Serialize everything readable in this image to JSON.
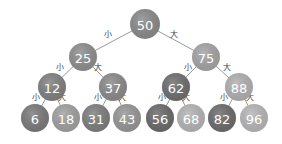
{
  "diagram": {
    "type": "binary-search-tree",
    "edge_labels": {
      "left": "小",
      "right": "大"
    },
    "nodes": [
      {
        "id": "n50",
        "value": "50",
        "x": 145,
        "y": 24,
        "r": 15,
        "color": "#8a8a8a"
      },
      {
        "id": "n25",
        "value": "25",
        "x": 83,
        "y": 57,
        "r": 14,
        "color": "#8e8e8e"
      },
      {
        "id": "n75",
        "value": "75",
        "x": 206,
        "y": 57,
        "r": 14,
        "color": "#a4a4a4"
      },
      {
        "id": "n12",
        "value": "12",
        "x": 52,
        "y": 87,
        "r": 14,
        "color": "#808080"
      },
      {
        "id": "n37",
        "value": "37",
        "x": 113,
        "y": 87,
        "r": 14,
        "color": "#8a8a8a"
      },
      {
        "id": "n62",
        "value": "62",
        "x": 176,
        "y": 87,
        "r": 14,
        "color": "#6e6e6e"
      },
      {
        "id": "n88",
        "value": "88",
        "x": 239,
        "y": 87,
        "r": 14,
        "color": "#b0b0b0"
      },
      {
        "id": "n6",
        "value": "6",
        "x": 35,
        "y": 118,
        "r": 14,
        "color": "#7a7a7a"
      },
      {
        "id": "n18",
        "value": "18",
        "x": 66,
        "y": 118,
        "r": 14,
        "color": "#a0a0a0"
      },
      {
        "id": "n31",
        "value": "31",
        "x": 96,
        "y": 118,
        "r": 14,
        "color": "#7e7e7e"
      },
      {
        "id": "n43",
        "value": "43",
        "x": 127,
        "y": 118,
        "r": 14,
        "color": "#969696"
      },
      {
        "id": "n56",
        "value": "56",
        "x": 160,
        "y": 118,
        "r": 14,
        "color": "#6a6a6a"
      },
      {
        "id": "n68",
        "value": "68",
        "x": 191,
        "y": 118,
        "r": 14,
        "color": "#b4b4b4"
      },
      {
        "id": "n82",
        "value": "82",
        "x": 222,
        "y": 118,
        "r": 14,
        "color": "#6c6c6c"
      },
      {
        "id": "n96",
        "value": "96",
        "x": 254,
        "y": 118,
        "r": 14,
        "color": "#b6b6b6"
      }
    ],
    "edges": [
      {
        "from": "n50",
        "to": "n25",
        "label": "小",
        "lx": 108,
        "ly": 37
      },
      {
        "from": "n50",
        "to": "n75",
        "label": "大",
        "lx": 174,
        "ly": 37
      },
      {
        "from": "n25",
        "to": "n12",
        "label": "小",
        "lx": 60,
        "ly": 70
      },
      {
        "from": "n25",
        "to": "n37",
        "label": "大",
        "lx": 98,
        "ly": 70
      },
      {
        "from": "n75",
        "to": "n62",
        "label": "小",
        "lx": 188,
        "ly": 70
      },
      {
        "from": "n75",
        "to": "n88",
        "label": "大",
        "lx": 227,
        "ly": 70
      },
      {
        "from": "n12",
        "to": "n6",
        "label": "小",
        "lx": 36,
        "ly": 100
      },
      {
        "from": "n12",
        "to": "n18",
        "label": "大",
        "lx": 62,
        "ly": 100
      },
      {
        "from": "n37",
        "to": "n31",
        "label": "小",
        "lx": 98,
        "ly": 100
      },
      {
        "from": "n37",
        "to": "n43",
        "label": "大",
        "lx": 122,
        "ly": 100
      },
      {
        "from": "n62",
        "to": "n56",
        "label": "小",
        "lx": 162,
        "ly": 100
      },
      {
        "from": "n62",
        "to": "n68",
        "label": "大",
        "lx": 186,
        "ly": 100
      },
      {
        "from": "n88",
        "to": "n82",
        "label": "小",
        "lx": 224,
        "ly": 100
      },
      {
        "from": "n88",
        "to": "n96",
        "label": "大",
        "lx": 250,
        "ly": 100
      }
    ]
  }
}
